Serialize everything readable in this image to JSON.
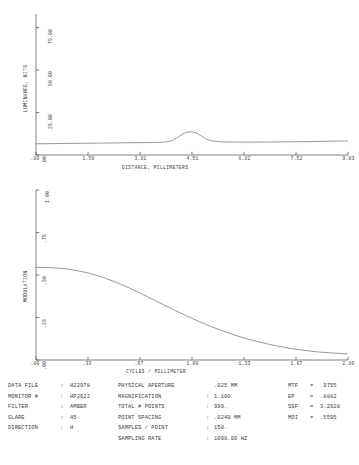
{
  "chart_data": [
    {
      "type": "line",
      "title": "",
      "xlabel": "DISTANCE, MILLIMETERS",
      "ylabel": "LUMINANCE, NITS",
      "xticks": [
        ".00",
        "1.50",
        "3.01",
        "4.51",
        "6.02",
        "7.52",
        "9.03"
      ],
      "yticks": [
        ".00",
        "25.00",
        "50.00",
        "75.00"
      ],
      "xlim": [
        0,
        9.03
      ],
      "ylim": [
        0,
        83
      ],
      "grid": false,
      "legend": "none",
      "points": [
        {
          "x": 0.0,
          "y": 6.6
        },
        {
          "x": 0.45,
          "y": 6.7
        },
        {
          "x": 0.9,
          "y": 6.8
        },
        {
          "x": 1.35,
          "y": 6.9
        },
        {
          "x": 1.81,
          "y": 7.0
        },
        {
          "x": 2.26,
          "y": 7.1
        },
        {
          "x": 2.71,
          "y": 7.2
        },
        {
          "x": 3.16,
          "y": 7.3
        },
        {
          "x": 3.61,
          "y": 7.5
        },
        {
          "x": 3.8,
          "y": 7.8
        },
        {
          "x": 3.95,
          "y": 8.6
        },
        {
          "x": 4.1,
          "y": 10.4
        },
        {
          "x": 4.25,
          "y": 12.4
        },
        {
          "x": 4.38,
          "y": 13.4
        },
        {
          "x": 4.51,
          "y": 13.6
        },
        {
          "x": 4.63,
          "y": 13.1
        },
        {
          "x": 4.76,
          "y": 11.6
        },
        {
          "x": 4.9,
          "y": 9.7
        },
        {
          "x": 5.05,
          "y": 8.5
        },
        {
          "x": 5.25,
          "y": 7.9
        },
        {
          "x": 5.5,
          "y": 7.7
        },
        {
          "x": 6.0,
          "y": 7.6
        },
        {
          "x": 6.5,
          "y": 7.6
        },
        {
          "x": 7.0,
          "y": 7.7
        },
        {
          "x": 7.5,
          "y": 7.8
        },
        {
          "x": 8.0,
          "y": 7.9
        },
        {
          "x": 8.5,
          "y": 8.1
        },
        {
          "x": 9.03,
          "y": 8.3
        }
      ]
    },
    {
      "type": "line",
      "title": "",
      "xlabel": "CYCLES / MILLIMETER",
      "ylabel": "MODULATION",
      "xticks": [
        ".00",
        ".33",
        ".67",
        "1.00",
        "1.33",
        "1.67",
        "2.00"
      ],
      "yticks": [
        ".00",
        ".25",
        ".50",
        ".75",
        "1.00"
      ],
      "xlim": [
        0,
        2.0
      ],
      "ylim": [
        0,
        1.0
      ],
      "grid": false,
      "legend": "none",
      "points": [
        {
          "x": 0.0,
          "y": 0.545
        },
        {
          "x": 0.1,
          "y": 0.543
        },
        {
          "x": 0.2,
          "y": 0.535
        },
        {
          "x": 0.3,
          "y": 0.519
        },
        {
          "x": 0.4,
          "y": 0.495
        },
        {
          "x": 0.5,
          "y": 0.462
        },
        {
          "x": 0.6,
          "y": 0.423
        },
        {
          "x": 0.7,
          "y": 0.379
        },
        {
          "x": 0.8,
          "y": 0.333
        },
        {
          "x": 0.9,
          "y": 0.288
        },
        {
          "x": 1.0,
          "y": 0.245
        },
        {
          "x": 1.1,
          "y": 0.205
        },
        {
          "x": 1.2,
          "y": 0.17
        },
        {
          "x": 1.3,
          "y": 0.139
        },
        {
          "x": 1.4,
          "y": 0.113
        },
        {
          "x": 1.5,
          "y": 0.091
        },
        {
          "x": 1.6,
          "y": 0.073
        },
        {
          "x": 1.7,
          "y": 0.059
        },
        {
          "x": 1.8,
          "y": 0.048
        },
        {
          "x": 1.9,
          "y": 0.041
        },
        {
          "x": 2.0,
          "y": 0.037
        }
      ]
    }
  ],
  "data_panel": {
    "col1": [
      {
        "label": "DATA FILE",
        "sep": ":",
        "value": "H22978"
      },
      {
        "label": "MONITOR #",
        "sep": ":",
        "value": "HP2622"
      },
      {
        "label": "FILTER",
        "sep": ":",
        "value": "AMBER"
      },
      {
        "label": "GLARE",
        "sep": ":",
        "value": "45"
      },
      {
        "label": "DIRECTION",
        "sep": ":",
        "value": "H"
      }
    ],
    "col2": [
      {
        "label": "PHYSICAL APERTURE",
        "sep": "",
        "value": ".025 MM"
      },
      {
        "label": "MAGNIFICATION",
        "sep": ":",
        "value": "1.100"
      },
      {
        "label": "TOTAL # POINTS",
        "sep": ":",
        "value": "999."
      },
      {
        "label": "POINT SPACING",
        "sep": ":",
        "value": ".0249 MM"
      },
      {
        "label": "SAMPLES / POINT",
        "sep": ":",
        "value": "150."
      },
      {
        "label": "SAMPLING RATE",
        "sep": ":",
        "value": "1000.00 HZ"
      }
    ],
    "col3": [
      {
        "label": "MTF",
        "sep": "=",
        "value": ".9755"
      },
      {
        "label": "EP",
        "sep": "=",
        "value": ".8882"
      },
      {
        "label": "SSF",
        "sep": "=",
        "value": "3.2928"
      },
      {
        "label": "MOI",
        "sep": "=",
        "value": ".5595"
      }
    ]
  }
}
